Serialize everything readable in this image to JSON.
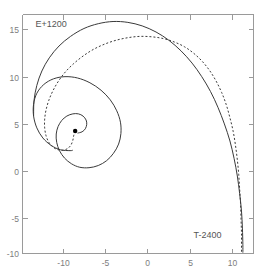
{
  "chart_data": {
    "type": "line",
    "title": "",
    "xlabel": "",
    "ylabel": "",
    "xlim": [
      -13.5,
      11.5
    ],
    "ylim": [
      -10.3,
      17.0
    ],
    "grid": false,
    "legend_position": "none",
    "xticks": [
      -10,
      -5,
      0,
      5,
      10
    ],
    "xticklabels": [
      "-10",
      "-5",
      "0",
      "5",
      "10"
    ],
    "yticks": [
      15,
      10,
      5,
      0,
      -5,
      -10
    ],
    "yticklabels": [
      "15",
      "10",
      "5",
      "0",
      "-5",
      "-10"
    ],
    "annotations": [
      {
        "text": "E+1200",
        "x": -12.1,
        "y": 15.6
      },
      {
        "text": "T-2400",
        "x": 5.0,
        "y": -8.5
      }
    ],
    "markers": [
      {
        "name": "spiral-center-dot",
        "x": -7.8,
        "y": 3.7,
        "radius": 2.2
      }
    ],
    "series": [
      {
        "name": "solid-trajectory",
        "style": "solid",
        "color": "#3a3a3a",
        "points": [
          [
            -7.55,
            3.45
          ],
          [
            -7.05,
            3.6
          ],
          [
            -6.7,
            3.95
          ],
          [
            -6.55,
            4.45
          ],
          [
            -6.62,
            4.95
          ],
          [
            -6.95,
            5.4
          ],
          [
            -7.45,
            5.65
          ],
          [
            -8.05,
            5.65
          ],
          [
            -8.7,
            5.4
          ],
          [
            -9.25,
            4.9
          ],
          [
            -9.65,
            4.2
          ],
          [
            -9.85,
            3.35
          ],
          [
            -9.8,
            2.4
          ],
          [
            -9.5,
            1.45
          ],
          [
            -8.95,
            0.6
          ],
          [
            -8.2,
            -0.05
          ],
          [
            -7.3,
            -0.45
          ],
          [
            -6.3,
            -0.5
          ],
          [
            -5.3,
            -0.25
          ],
          [
            -4.4,
            0.3
          ],
          [
            -3.65,
            1.15
          ],
          [
            -3.1,
            2.2
          ],
          [
            -2.85,
            3.4
          ],
          [
            -2.9,
            4.7
          ],
          [
            -3.3,
            6.0
          ],
          [
            -4.0,
            7.25
          ],
          [
            -5.0,
            8.35
          ],
          [
            -6.2,
            9.2
          ],
          [
            -7.55,
            9.75
          ],
          [
            -8.9,
            9.9
          ],
          [
            -10.15,
            9.65
          ],
          [
            -11.2,
            9.0
          ],
          [
            -11.95,
            8.0
          ],
          [
            -12.3,
            6.75
          ],
          [
            -12.3,
            5.4
          ],
          [
            -11.95,
            4.05
          ],
          [
            -11.3,
            2.9
          ],
          [
            -10.4,
            2.05
          ],
          [
            -9.4,
            1.55
          ],
          [
            -8.35,
            1.45
          ],
          [
            -8.05,
            1.5
          ]
        ]
      },
      {
        "name": "solid-trajectory-outer",
        "style": "solid",
        "color": "#3a3a3a",
        "points": [
          [
            -12.3,
            5.4
          ],
          [
            -12.25,
            7.2
          ],
          [
            -11.95,
            8.9
          ],
          [
            -11.4,
            10.55
          ],
          [
            -10.6,
            12.05
          ],
          [
            -9.55,
            13.4
          ],
          [
            -8.3,
            14.5
          ],
          [
            -6.85,
            15.4
          ],
          [
            -5.3,
            15.95
          ],
          [
            -3.7,
            16.2
          ],
          [
            -2.1,
            16.1
          ],
          [
            -0.55,
            15.7
          ],
          [
            0.95,
            15.0
          ],
          [
            2.35,
            14.05
          ],
          [
            3.65,
            12.85
          ],
          [
            4.85,
            11.45
          ],
          [
            5.9,
            9.9
          ],
          [
            6.85,
            8.2
          ],
          [
            7.65,
            6.4
          ],
          [
            8.35,
            4.5
          ],
          [
            8.95,
            2.55
          ],
          [
            9.4,
            0.55
          ],
          [
            9.75,
            -1.45
          ],
          [
            10.0,
            -3.45
          ],
          [
            10.2,
            -5.45
          ],
          [
            10.3,
            -7.4
          ],
          [
            10.35,
            -9.3
          ],
          [
            10.35,
            -10.2
          ]
        ]
      },
      {
        "name": "dashed-trajectory",
        "style": "dashed",
        "color": "#3a3a3a",
        "points": [
          [
            -7.8,
            3.7
          ],
          [
            -7.95,
            3.2
          ],
          [
            -8.05,
            2.65
          ],
          [
            -8.25,
            2.1
          ],
          [
            -8.6,
            1.7
          ],
          [
            -9.1,
            1.5
          ],
          [
            -9.65,
            1.55
          ],
          [
            -10.2,
            1.85
          ],
          [
            -10.65,
            2.4
          ],
          [
            -10.95,
            3.15
          ],
          [
            -11.1,
            4.05
          ],
          [
            -11.1,
            5.05
          ],
          [
            -10.95,
            6.1
          ],
          [
            -10.65,
            7.2
          ],
          [
            -10.2,
            8.3
          ],
          [
            -9.6,
            9.4
          ],
          [
            -8.85,
            10.45
          ],
          [
            -7.95,
            11.4
          ],
          [
            -6.95,
            12.25
          ],
          [
            -5.85,
            13.0
          ],
          [
            -4.65,
            13.6
          ],
          [
            -3.4,
            14.05
          ],
          [
            -2.1,
            14.35
          ],
          [
            -0.8,
            14.5
          ],
          [
            0.5,
            14.45
          ],
          [
            1.75,
            14.25
          ],
          [
            2.95,
            13.85
          ],
          [
            4.05,
            13.3
          ],
          [
            5.05,
            12.55
          ],
          [
            5.95,
            11.65
          ],
          [
            6.75,
            10.6
          ],
          [
            7.45,
            9.4
          ],
          [
            8.05,
            8.1
          ],
          [
            8.55,
            6.7
          ],
          [
            8.95,
            5.2
          ],
          [
            9.3,
            3.65
          ],
          [
            9.55,
            2.05
          ],
          [
            9.75,
            0.4
          ],
          [
            9.9,
            -1.25
          ],
          [
            10.0,
            -2.95
          ],
          [
            10.1,
            -4.65
          ],
          [
            10.15,
            -6.35
          ],
          [
            10.2,
            -8.05
          ],
          [
            10.2,
            -9.7
          ],
          [
            10.2,
            -10.2
          ]
        ]
      }
    ]
  },
  "figure": {
    "background_color": "#ffffff",
    "axis_color": "#9a9a9a",
    "tick_label_color": "#7d7d7d",
    "annotation_color": "#555555",
    "curve_color": "#3a3a3a"
  }
}
